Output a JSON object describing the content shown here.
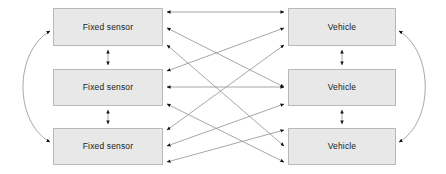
{
  "diagram": {
    "canvas": {
      "width": 446,
      "height": 174
    },
    "style": {
      "node_fill": "#e8e8e8",
      "node_stroke": "#b9b9b9",
      "edge_color": "#7a7a7a",
      "arrow_color": "#111111",
      "label_color": "#1a1a1a",
      "background": "#ffffff"
    },
    "labels": {
      "fixed_sensor": "Fixed sensor",
      "vehicle": "Vehicle"
    },
    "nodes": [
      {
        "id": "sensor-1",
        "label": "Fixed sensor",
        "group": "fixed-sensor",
        "row": 1,
        "x": 53,
        "y": 8,
        "width": 110,
        "height": 38
      },
      {
        "id": "sensor-2",
        "label": "Fixed sensor",
        "group": "fixed-sensor",
        "row": 2,
        "x": 53,
        "y": 69,
        "width": 110,
        "height": 37
      },
      {
        "id": "sensor-3",
        "label": "Fixed sensor",
        "group": "fixed-sensor",
        "row": 3,
        "x": 53,
        "y": 128,
        "width": 110,
        "height": 37
      },
      {
        "id": "vehicle-1",
        "label": "Vehicle",
        "group": "vehicle",
        "row": 1,
        "x": 288,
        "y": 8,
        "width": 108,
        "height": 38
      },
      {
        "id": "vehicle-2",
        "label": "Vehicle",
        "group": "vehicle",
        "row": 2,
        "x": 288,
        "y": 69,
        "width": 108,
        "height": 37
      },
      {
        "id": "vehicle-3",
        "label": "Vehicle",
        "group": "vehicle",
        "row": 3,
        "x": 288,
        "y": 128,
        "width": 108,
        "height": 37
      }
    ],
    "edges": [
      {
        "id": "edge-sensor1-vehicle1",
        "from": "sensor-1",
        "to": "vehicle-1",
        "kind": "straight",
        "bidirectional": true
      },
      {
        "id": "edge-sensor1-vehicle2",
        "from": "sensor-1",
        "to": "vehicle-2",
        "kind": "straight",
        "bidirectional": true
      },
      {
        "id": "edge-sensor1-vehicle3",
        "from": "sensor-1",
        "to": "vehicle-3",
        "kind": "straight",
        "bidirectional": true
      },
      {
        "id": "edge-sensor2-vehicle1",
        "from": "sensor-2",
        "to": "vehicle-1",
        "kind": "straight",
        "bidirectional": true
      },
      {
        "id": "edge-sensor2-vehicle2",
        "from": "sensor-2",
        "to": "vehicle-2",
        "kind": "straight",
        "bidirectional": true
      },
      {
        "id": "edge-sensor2-vehicle3",
        "from": "sensor-2",
        "to": "vehicle-3",
        "kind": "straight",
        "bidirectional": true
      },
      {
        "id": "edge-sensor3-vehicle1",
        "from": "sensor-3",
        "to": "vehicle-1",
        "kind": "straight",
        "bidirectional": true
      },
      {
        "id": "edge-sensor3-vehicle2",
        "from": "sensor-3",
        "to": "vehicle-2",
        "kind": "straight",
        "bidirectional": true
      },
      {
        "id": "edge-sensor3-vehicle3",
        "from": "sensor-3",
        "to": "vehicle-3",
        "kind": "straight",
        "bidirectional": true
      },
      {
        "id": "edge-sensor1-sensor2",
        "from": "sensor-1",
        "to": "sensor-2",
        "kind": "vertical",
        "bidirectional": true
      },
      {
        "id": "edge-sensor2-sensor3",
        "from": "sensor-2",
        "to": "sensor-3",
        "kind": "vertical",
        "bidirectional": true
      },
      {
        "id": "edge-vehicle1-vehicle2",
        "from": "vehicle-1",
        "to": "vehicle-2",
        "kind": "vertical",
        "bidirectional": true
      },
      {
        "id": "edge-vehicle2-vehicle3",
        "from": "vehicle-2",
        "to": "vehicle-3",
        "kind": "vertical",
        "bidirectional": true
      },
      {
        "id": "edge-sensor1-sensor3",
        "from": "sensor-1",
        "to": "sensor-3",
        "kind": "curve-left",
        "bidirectional": true
      },
      {
        "id": "edge-vehicle1-vehicle3",
        "from": "vehicle-1",
        "to": "vehicle-3",
        "kind": "curve-right",
        "bidirectional": true
      }
    ]
  }
}
